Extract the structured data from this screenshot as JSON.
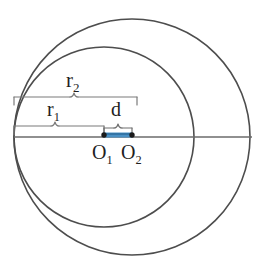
{
  "figure": {
    "type": "geometry-diagram",
    "background_color": "#ffffff",
    "stroke_color": "#4d4d4d",
    "highlight_color": "#4a90c4",
    "canvas": {
      "width": 268,
      "height": 275
    }
  },
  "labels": {
    "r2": {
      "base": "r",
      "sub": "2",
      "text": "r2"
    },
    "r1": {
      "base": "r",
      "sub": "1",
      "text": "r1"
    },
    "d": {
      "base": "d",
      "sub": "",
      "text": "d"
    },
    "o1": {
      "base": "O",
      "sub": "1",
      "text": "O1"
    },
    "o2": {
      "base": "O",
      "sub": "2",
      "text": "O2"
    }
  },
  "geometry": {
    "outer_circle": {
      "name": "outer-circle",
      "center_label": "O2",
      "cx": 132,
      "cy": 137,
      "r": 118,
      "radius_label": "r2"
    },
    "inner_circle": {
      "name": "inner-circle",
      "center_label": "O1",
      "cx": 104,
      "cy": 137,
      "r": 90,
      "radius_label": "r1"
    },
    "axis_line": {
      "name": "horizontal-diameter-line",
      "x1": 14,
      "y1": 137,
      "x2": 252,
      "y2": 137
    },
    "centers": [
      {
        "label": "O1",
        "x": 104,
        "y": 137
      },
      {
        "label": "O2",
        "x": 132,
        "y": 137
      }
    ],
    "distance_segment": {
      "name": "d-segment",
      "from": "O1",
      "to": "O2",
      "x1": 104,
      "y1": 135,
      "x2": 132,
      "y2": 135,
      "color": "#4a90c4",
      "length_label": "d"
    },
    "brackets": [
      {
        "name": "r2-bracket",
        "label": "r2",
        "x_start": 14,
        "x_end": 137,
        "y": 97,
        "tick_down": 8
      },
      {
        "name": "r1-bracket",
        "label": "r1",
        "x_start": 14,
        "x_end": 104,
        "y": 126,
        "tick_down": 8
      },
      {
        "name": "d-bracket",
        "label": "d",
        "x_start": 104,
        "x_end": 132,
        "y": 126,
        "tick_down": 6
      }
    ]
  }
}
